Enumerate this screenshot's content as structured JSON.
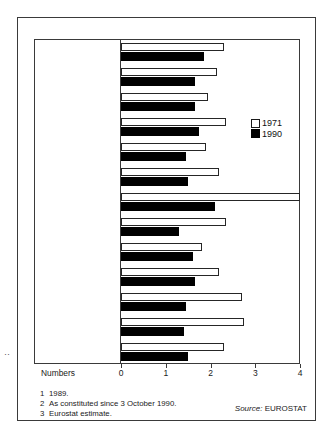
{
  "chart_data": {
    "type": "bar",
    "orientation": "horizontal",
    "title": "",
    "xlabel": "Numbers",
    "ylabel": "",
    "xlim": [
      0,
      4
    ],
    "xticks": [
      0,
      1,
      2,
      3,
      4
    ],
    "xticklabels": [
      "0",
      "1",
      "2",
      "3",
      "4"
    ],
    "grid": false,
    "legend_position": "upper right",
    "categories": [
      "United Kingdom",
      "Belgium",
      "Denmark",
      "France",
      "Germany (Fed Rep)",
      "Greece",
      "Irish Republic",
      "Italy",
      "Luxembourg",
      "Netherlands",
      "Portugal",
      "Spain",
      "Eur 12"
    ],
    "category_footnote_marks": [
      "1",
      "",
      "",
      "",
      "2",
      "",
      "",
      "",
      "",
      "",
      "",
      "",
      "3"
    ],
    "series": [
      {
        "name": "1971",
        "color": "#ffffff",
        "values": [
          2.3,
          2.15,
          1.95,
          2.35,
          1.9,
          2.2,
          4.0,
          2.35,
          1.8,
          2.2,
          2.7,
          2.75,
          2.3
        ]
      },
      {
        "name": "1990",
        "color": "#000000",
        "values": [
          1.85,
          1.65,
          1.65,
          1.75,
          1.45,
          1.5,
          2.1,
          1.3,
          1.6,
          1.65,
          1.45,
          1.4,
          1.5
        ]
      }
    ]
  },
  "labels": {
    "united_kingdom": "United Kingdom",
    "belgium": "Belgium",
    "denmark": "Denmark",
    "france": "France",
    "germany_line1": "Germany",
    "germany_line2": "(Fed Rep)",
    "greece": "Greece",
    "irish_republic": "Irish Republic",
    "italy": "Italy",
    "luxembourg": "Luxembourg",
    "netherlands": "Netherlands",
    "portugal": "Portugal",
    "spain": "Spain",
    "eur12": "Eur 12"
  },
  "legend": {
    "items": [
      {
        "label": "1971",
        "swatch": "hollow-white-square"
      },
      {
        "label": "1990",
        "swatch": "filled-black-square"
      }
    ]
  },
  "axis": {
    "label": "Numbers",
    "ticks": [
      "0",
      "1",
      "2",
      "3",
      "4"
    ]
  },
  "footnotes": [
    {
      "num": "1",
      "text": "1989."
    },
    {
      "num": "2",
      "text": "As constituted since 3 October 1990."
    },
    {
      "num": "3",
      "text": "Eurostat estimate."
    }
  ],
  "source": {
    "prefix": "Source:",
    "value": "EUROSTAT"
  },
  "marks": {
    "left_edge_artifact": "··"
  },
  "colors": {
    "frame": "#3a3a3a",
    "bar_1971": "#ffffff",
    "bar_1990": "#000000",
    "text": "#1a1a1a",
    "background": "#ffffff"
  }
}
